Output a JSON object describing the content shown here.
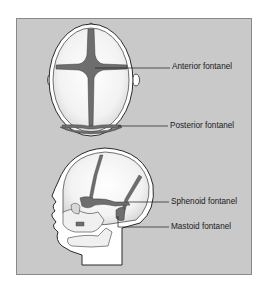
{
  "figure": {
    "views": [
      {
        "id": "top-view",
        "description": "Infant skull viewed from above",
        "labels": [
          {
            "text": "Anterior fontanel"
          },
          {
            "text": "Posterior fontanel"
          }
        ]
      },
      {
        "id": "side-view",
        "description": "Infant skull viewed from the side",
        "labels": [
          {
            "text": "Sphenoid fontanel"
          },
          {
            "text": "Mastoid fontanel"
          }
        ]
      }
    ],
    "colors": {
      "panel_bg": "#c9c9c9",
      "bone": "#f4f4f4",
      "fontanel": "#6e6e6e",
      "outline": "#2a2a2a",
      "scalp": "#ffffff"
    }
  }
}
